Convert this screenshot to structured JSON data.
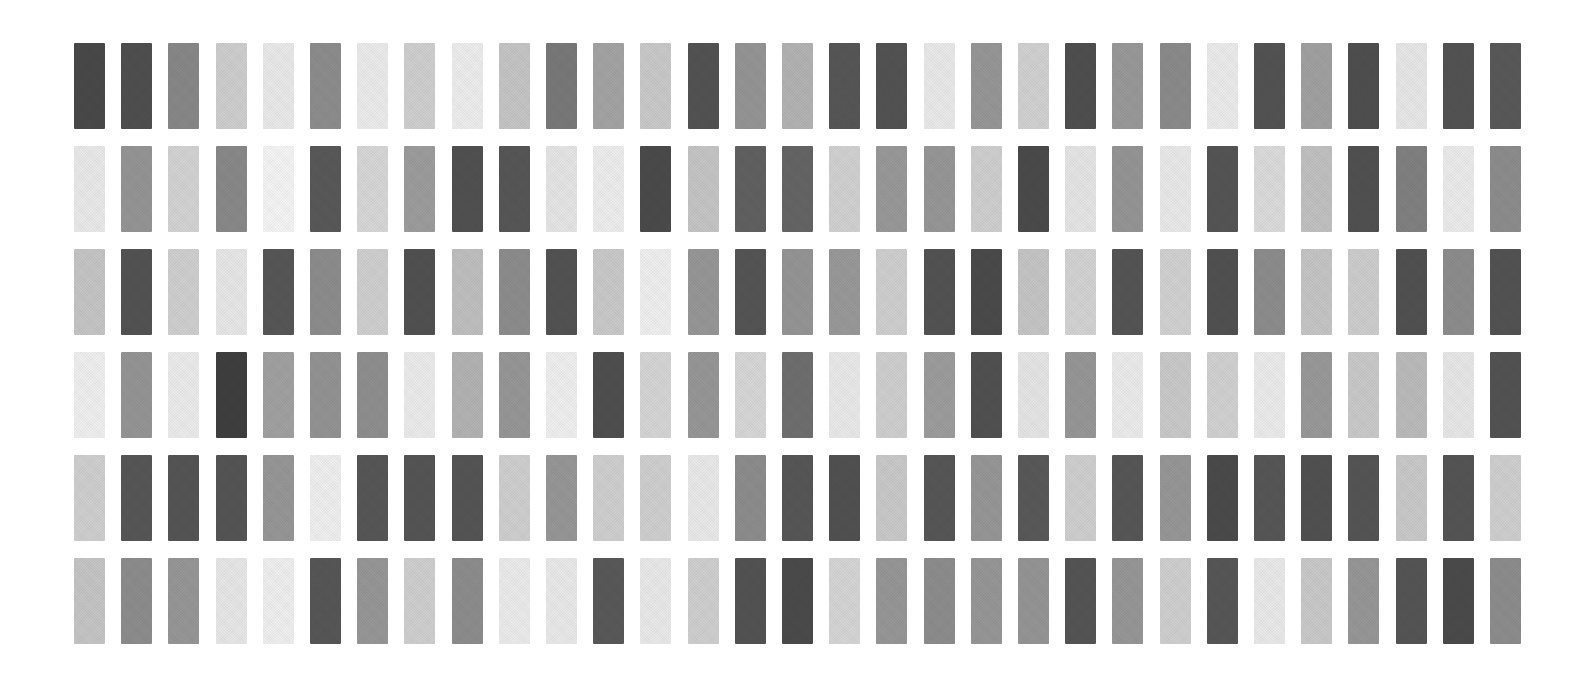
{
  "page": {
    "background_color": "#ffffff",
    "width": 1579,
    "height": 682
  },
  "grid": {
    "rows": 6,
    "columns": 31,
    "origin_x": 74,
    "origin_y": 43,
    "bar_width": 31,
    "bar_height": 86,
    "column_pitch": 47.2,
    "row_pitch": 103
  },
  "chart_data": {
    "type": "heatmap",
    "xlabel": "",
    "ylabel": "",
    "legend": [],
    "grid_on": false,
    "rows": 6,
    "columns": 31,
    "value_range": [
      0,
      255
    ],
    "note": "Each cell is a vertical rectangle filled with a gray level; value = 8-bit luminance",
    "series": [
      {
        "name": "row-1",
        "values": [
          72,
          78,
          135,
          205,
          232,
          140,
          234,
          206,
          236,
          196,
          120,
          163,
          200,
          82,
          148,
          178,
          86,
          82,
          232,
          150,
          208,
          78,
          152,
          138,
          234,
          82,
          160,
          78,
          230,
          82,
          88
        ]
      },
      {
        "name": "row-2",
        "values": [
          232,
          148,
          210,
          136,
          243,
          88,
          214,
          156,
          80,
          86,
          228,
          236,
          74,
          196,
          96,
          100,
          208,
          152,
          150,
          206,
          74,
          228,
          148,
          232,
          84,
          218,
          192,
          80,
          128,
          234,
          140
        ]
      },
      {
        "name": "row-3",
        "values": [
          196,
          82,
          206,
          230,
          86,
          140,
          206,
          80,
          190,
          140,
          82,
          200,
          238,
          150,
          84,
          148,
          152,
          206,
          82,
          74,
          196,
          210,
          84,
          208,
          80,
          140,
          196,
          204,
          80,
          140,
          82
        ]
      },
      {
        "name": "row-4",
        "values": [
          238,
          148,
          234,
          62,
          160,
          146,
          142,
          234,
          178,
          150,
          238,
          78,
          212,
          150,
          214,
          110,
          232,
          206,
          156,
          80,
          228,
          150,
          234,
          200,
          208,
          234,
          152,
          200,
          186,
          230,
          82
        ]
      },
      {
        "name": "row-5",
        "values": [
          206,
          86,
          84,
          84,
          150,
          238,
          86,
          84,
          84,
          206,
          150,
          206,
          206,
          232,
          140,
          86,
          80,
          200,
          86,
          150,
          88,
          206,
          86,
          150,
          74,
          86,
          80,
          84,
          200,
          84,
          206
        ]
      },
      {
        "name": "row-6",
        "values": [
          196,
          140,
          150,
          230,
          238,
          86,
          150,
          206,
          140,
          234,
          232,
          88,
          232,
          206,
          82,
          74,
          212,
          150,
          140,
          150,
          148,
          84,
          150,
          206,
          86,
          232,
          200,
          150,
          84,
          74,
          140
        ]
      }
    ]
  }
}
